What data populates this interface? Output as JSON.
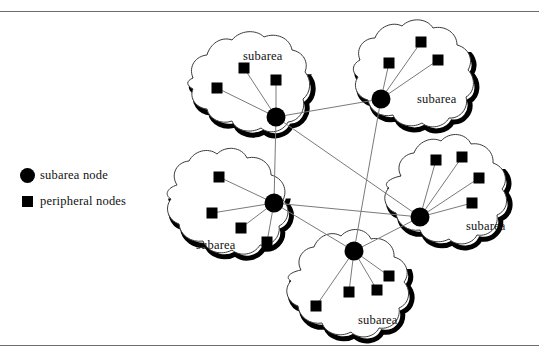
{
  "figure": {
    "width": 539,
    "height": 357,
    "background": "#ffffff",
    "rule_color": "#6d6d6d",
    "line_color": "#7a7a7a",
    "node_color": "#000000",
    "blob_outline_color": "#3a3a3a",
    "blob_shadow_color": "#000000"
  },
  "legend": {
    "items": [
      {
        "glyph": "filled-circle",
        "label": "subarea node"
      },
      {
        "glyph": "filled-square",
        "label": "peripheral nodes"
      }
    ]
  },
  "subareas": [
    {
      "id": "top-left",
      "label": "subarea",
      "label_x": 243,
      "label_y": 49,
      "hub": {
        "x": 276,
        "y": 117,
        "r": 9.5
      },
      "peripherals": [
        {
          "x": 217,
          "y": 88
        },
        {
          "x": 244,
          "y": 68
        },
        {
          "x": 276,
          "y": 80
        }
      ],
      "outline": "M 193 78 C 188 66 196 56 207 55 C 210 44 221 36 232 40 C 240 30 256 29 264 37 C 276 32 290 38 292 50 C 303 52 309 62 305 72 C 312 80 311 93 303 99 C 306 110 299 121 288 122 C 283 132 269 135 261 128 C 250 134 236 131 232 121 C 221 125 209 119 207 109 C 196 108 189 98 193 89 C 186 85 186 81 193 78 Z"
    },
    {
      "id": "top-right",
      "label": "subarea",
      "label_x": 417,
      "label_y": 92,
      "hub": {
        "x": 381,
        "y": 99,
        "r": 9.5
      },
      "peripherals": [
        {
          "x": 389,
          "y": 63
        },
        {
          "x": 421,
          "y": 42
        },
        {
          "x": 438,
          "y": 60
        }
      ],
      "outline": "M 360 60 C 355 48 364 38 375 38 C 379 27 392 21 402 26 C 411 17 427 18 433 28 C 445 25 457 33 457 45 C 469 48 474 60 468 70 C 476 78 475 92 466 97 C 469 108 460 119 449 118 C 444 127 430 130 422 123 C 411 129 397 125 393 115 C 381 118 370 111 368 100 C 357 97 352 86 358 77 C 351 72 352 64 360 60 Z"
    },
    {
      "id": "middle-left",
      "label": "subarea",
      "label_x": 196,
      "label_y": 238,
      "hub": {
        "x": 274,
        "y": 203,
        "r": 9.5
      },
      "peripherals": [
        {
          "x": 219,
          "y": 177
        },
        {
          "x": 212,
          "y": 213
        },
        {
          "x": 241,
          "y": 228
        },
        {
          "x": 267,
          "y": 242
        }
      ],
      "outline": "M 177 185 C 170 174 177 162 189 161 C 194 151 208 147 217 154 C 226 145 242 147 247 158 C 259 155 271 163 271 175 C 283 178 288 190 283 200 C 291 208 289 221 279 226 C 281 237 271 247 260 245 C 254 255 240 257 232 250 C 221 256 207 252 203 241 C 191 243 180 235 179 224 C 168 220 164 208 171 199 C 164 195 167 188 177 185 Z"
    },
    {
      "id": "right",
      "label": "subarea",
      "label_x": 466,
      "label_y": 219,
      "hub": {
        "x": 420,
        "y": 217,
        "r": 9.5
      },
      "peripherals": [
        {
          "x": 436,
          "y": 160
        },
        {
          "x": 462,
          "y": 157
        },
        {
          "x": 479,
          "y": 178
        },
        {
          "x": 472,
          "y": 203
        }
      ],
      "outline": "M 401 176 C 395 165 403 154 414 153 C 418 142 431 136 441 141 C 450 131 466 133 471 144 C 483 142 494 151 493 163 C 505 167 509 180 502 189 C 510 198 507 211 497 215 C 499 227 489 237 477 235 C 472 245 457 247 449 239 C 438 245 424 241 420 230 C 408 232 397 224 396 213 C 385 209 381 196 389 188 C 382 184 390 178 401 176 Z"
    },
    {
      "id": "bottom",
      "label": "subarea",
      "label_x": 358,
      "label_y": 313,
      "hub": {
        "x": 354,
        "y": 251,
        "r": 9.5
      },
      "peripherals": [
        {
          "x": 389,
          "y": 276
        },
        {
          "x": 349,
          "y": 292
        },
        {
          "x": 377,
          "y": 290
        },
        {
          "x": 316,
          "y": 306
        }
      ],
      "outline": "M 301 270 C 295 259 303 248 314 247 C 318 236 331 230 341 236 C 350 226 366 228 371 239 C 383 236 395 245 394 257 C 406 260 411 273 404 282 C 412 291 409 304 399 308 C 401 320 391 330 379 328 C 374 338 359 340 351 332 C 340 338 326 334 322 323 C 310 325 299 317 298 306 C 287 302 283 289 291 281 C 284 277 291 272 301 270 Z"
    }
  ],
  "backbone_links": [
    {
      "from": "top-left",
      "to": "top-right"
    },
    {
      "from": "top-left",
      "to": "right"
    },
    {
      "from": "top-left",
      "to": "middle-left"
    },
    {
      "from": "top-right",
      "to": "bottom"
    },
    {
      "from": "middle-left",
      "to": "right"
    },
    {
      "from": "middle-left",
      "to": "bottom"
    },
    {
      "from": "right",
      "to": "bottom"
    }
  ]
}
